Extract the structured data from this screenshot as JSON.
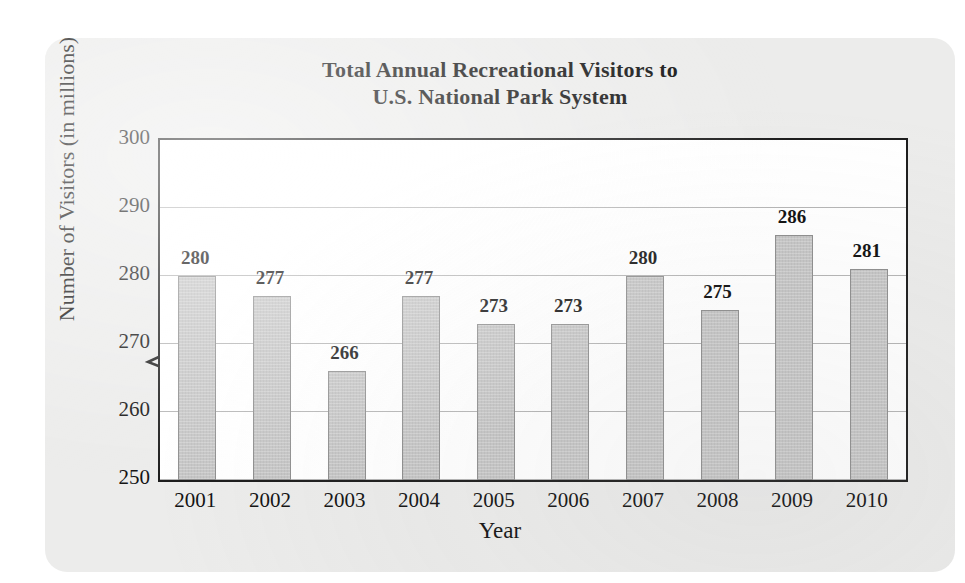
{
  "chart_data": {
    "type": "bar",
    "title": "Total Annual Recreational Visitors to U.S. National Park System",
    "title_line1": "Total Annual Recreational Visitors to",
    "title_line2": "U.S. National Park System",
    "xlabel": "Year",
    "ylabel": "Number of Visitors (in millions)",
    "categories": [
      "2001",
      "2002",
      "2003",
      "2004",
      "2005",
      "2006",
      "2007",
      "2008",
      "2009",
      "2010"
    ],
    "values": [
      280,
      277,
      266,
      277,
      273,
      273,
      280,
      275,
      286,
      281
    ],
    "ylim": [
      250,
      300
    ],
    "yticks": [
      250,
      260,
      270,
      280,
      290,
      300
    ],
    "grid": true,
    "axis_break": true,
    "legend": "none",
    "bar_color": "#c6c6c6",
    "bar_edge_color": "#8f8f8f",
    "plot_border_color": "#1d1d1d",
    "gridline_color": "#b5b5b5",
    "background_color": "#ececeb",
    "plot_background_color": "#ffffff",
    "text_color": "#111111"
  }
}
